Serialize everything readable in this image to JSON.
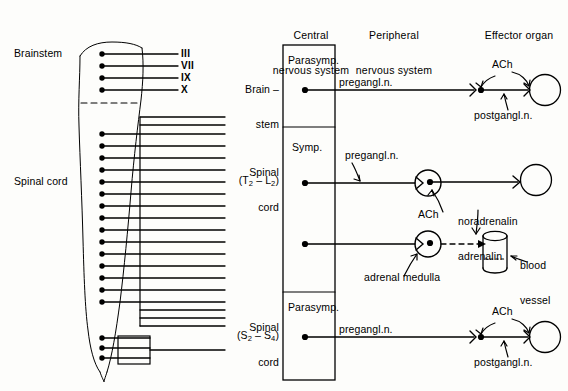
{
  "figure": {
    "background_color": "#fdfdfb",
    "ink_color": "#000000"
  },
  "columns": [
    {
      "id": "central",
      "line1": "Central",
      "line2": "nervous system"
    },
    {
      "id": "peripheral",
      "line1": "Peripheral",
      "line2": "nervous system"
    },
    {
      "id": "effector",
      "line1": "Effector organ",
      "line2": ""
    }
  ],
  "anatomy": {
    "brainstem_label": "Brainstem",
    "spinal_cord_label": "Spinal cord",
    "cranial_nerves": [
      "III",
      "VII",
      "IX",
      "X"
    ]
  },
  "rows": [
    {
      "id": "row-cranial-parasympathetic",
      "origin_line1": "Brain –",
      "origin_line2": "stem",
      "origin_level": "",
      "division": "Parasymp.",
      "preganglionic_label": "pregangl.n.",
      "postganglionic_label": "postgangl.n.",
      "transmitter_1": "ACh",
      "transmitter_2": "ACh",
      "effector": "circle"
    },
    {
      "id": "row-sympathetic-organ",
      "origin_line1": "Spinal",
      "origin_line2": "cord",
      "origin_level": "(T2 – L2)",
      "origin_level_parts": {
        "open": "(T",
        "sub1": "2",
        "dash": " – L",
        "sub2": "2",
        "close": ")"
      },
      "division": "Symp.",
      "preganglionic_label": "pregangl.n.",
      "ganglion_transmitter": "ACh",
      "postganglionic_transmitter_line1": "noradrenalin",
      "postganglionic_transmitter_line2": "adrenalin",
      "effector": "circle"
    },
    {
      "id": "row-adrenal-medulla",
      "ganglion_label": "adrenal medulla",
      "transmitter": "ACh",
      "effector_label_line1": "blood",
      "effector_label_line2": "vessel",
      "effector": "cylinder"
    },
    {
      "id": "row-sacral-parasympathetic",
      "origin_line1": "Spinal",
      "origin_line2": "cord",
      "origin_level": "(S2 – S4)",
      "origin_level_parts": {
        "open": "(S",
        "sub1": "2",
        "dash": " – S",
        "sub2": "4",
        "close": ")"
      },
      "division": "Parasymp.",
      "preganglionic_label": "pregangl.n.",
      "postganglionic_label": "postgangl.n.",
      "transmitter_1": "ACh",
      "transmitter_2": "ACh",
      "effector": "circle"
    }
  ]
}
